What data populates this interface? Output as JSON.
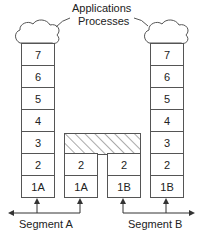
{
  "title": {
    "line1": "Applications",
    "line2": "Processes"
  },
  "left_stack": [
    "7",
    "6",
    "5",
    "4",
    "3",
    "2",
    "1A"
  ],
  "middle_a": [
    "2",
    "1A"
  ],
  "middle_b": [
    "2",
    "1B"
  ],
  "right_stack": [
    "7",
    "6",
    "5",
    "4",
    "3",
    "2",
    "1B"
  ],
  "segments": {
    "a": "Segment A",
    "b": "Segment B"
  }
}
